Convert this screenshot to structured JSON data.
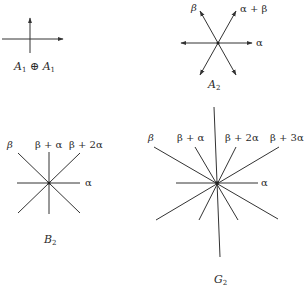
{
  "diagrams": {
    "a1a1": {
      "title_main": "A",
      "title_sub": "1",
      "title_op": " ⊕ ",
      "title_main2": "A",
      "title_sub2": "1"
    },
    "a2": {
      "title_main": "A",
      "title_sub": "2",
      "labels": {
        "beta": "β",
        "alpha_plus_beta": "α + β",
        "alpha": "α"
      }
    },
    "b2": {
      "title_main": "B",
      "title_sub": "2",
      "labels": {
        "beta": "β",
        "beta_plus_alpha": "β + α",
        "beta_plus_2alpha": "β + 2α",
        "alpha": "α"
      }
    },
    "g2": {
      "title_main": "G",
      "title_sub": "2",
      "labels": {
        "beta": "β",
        "beta_plus_alpha": "β + α",
        "beta_plus_2alpha": "β + 2α",
        "beta_plus_3alpha": "β + 3α",
        "alpha": "α"
      }
    }
  },
  "colors": {
    "stroke": "#333333",
    "text": "#2a2a2a"
  }
}
